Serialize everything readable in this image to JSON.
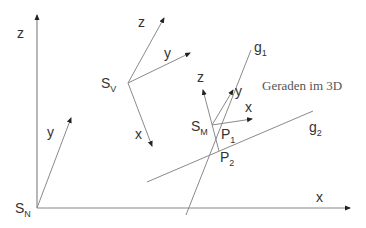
{
  "title": "Geraden im 3D",
  "colors": {
    "line": "#8a8a8a",
    "text": "#333333",
    "arrow": "#222222"
  },
  "world_frame": {
    "origin_label": "S",
    "origin_sub": "N",
    "axes": {
      "x": "x",
      "y": "y",
      "z": "z"
    }
  },
  "view_frame": {
    "origin_label": "S",
    "origin_sub": "V",
    "axes": {
      "x": "x",
      "y": "y",
      "z": "z"
    }
  },
  "midpoint_frame": {
    "origin_label": "S",
    "origin_sub": "M",
    "axes": {
      "x": "x",
      "y": "y",
      "z": "z"
    }
  },
  "lines": {
    "g1": {
      "label": "g",
      "sub": "1"
    },
    "g2": {
      "label": "g",
      "sub": "2"
    }
  },
  "points": {
    "p1": {
      "label": "P",
      "sub": "1"
    },
    "p2": {
      "label": "P",
      "sub": "2"
    }
  }
}
